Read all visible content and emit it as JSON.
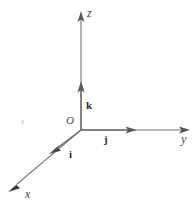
{
  "figure": {
    "background_color": "#ffffff",
    "width": 193,
    "height": 203
  },
  "style": {
    "axis_stroke_color": "#777777",
    "axis_stroke_width": 1.1,
    "unit_vector_stroke_color": "#6e6e6e",
    "unit_vector_stroke_width": 1.4,
    "axis_label_color": "#444444",
    "origin_label_color": "#4a4a4a",
    "unit_label_color": "#2e2e2e",
    "speck_color": "#e2e2e2"
  },
  "geometry": {
    "origin": {
      "x": 81,
      "y": 130
    },
    "z_axis_tip": {
      "x": 81,
      "y": 12
    },
    "y_axis_tip": {
      "x": 189,
      "y": 130
    },
    "x_axis_tip": {
      "x": 9,
      "y": 191
    },
    "k_vector_tip": {
      "x": 81,
      "y": 82
    },
    "j_vector_tip": {
      "x": 136,
      "y": 130
    },
    "i_vector_tip": {
      "x": 50,
      "y": 153
    }
  },
  "labels": {
    "origin": {
      "text": "O",
      "x": 66,
      "y": 115
    },
    "x_axis": {
      "text": "x",
      "x": 25,
      "y": 188
    },
    "y_axis": {
      "text": "y",
      "x": 181,
      "y": 133
    },
    "z_axis": {
      "text": "z",
      "x": 87,
      "y": 7
    },
    "i_vector": {
      "text": "i",
      "x": 69,
      "y": 149
    },
    "j_vector": {
      "text": "j",
      "x": 104,
      "y": 134
    },
    "k_vector": {
      "text": "k",
      "x": 86,
      "y": 100
    }
  },
  "artifacts": {
    "speck": {
      "x": 21,
      "y": 120
    }
  }
}
